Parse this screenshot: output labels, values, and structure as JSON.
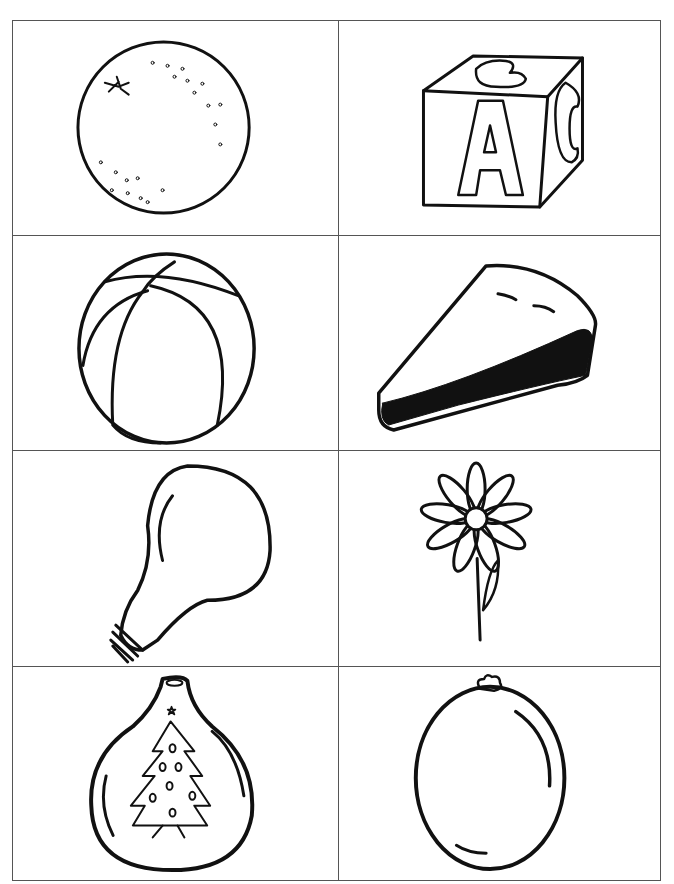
{
  "worksheet": {
    "layout": {
      "columns": 2,
      "rows": 4
    },
    "border_color": "#555555",
    "ink_color": "#111111",
    "cards": [
      {
        "row": 1,
        "col": 1,
        "picture": "orange"
      },
      {
        "row": 1,
        "col": 2,
        "picture": "abc-block"
      },
      {
        "row": 2,
        "col": 1,
        "picture": "ball"
      },
      {
        "row": 2,
        "col": 2,
        "picture": "pie-slice"
      },
      {
        "row": 3,
        "col": 1,
        "picture": "light-bulb"
      },
      {
        "row": 3,
        "col": 2,
        "picture": "flower"
      },
      {
        "row": 4,
        "col": 1,
        "picture": "ornament"
      },
      {
        "row": 4,
        "col": 2,
        "picture": "balloon"
      }
    ]
  }
}
